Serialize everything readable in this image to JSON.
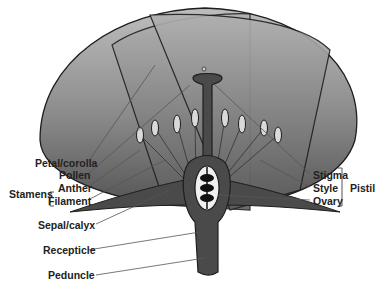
{
  "diagram": {
    "title": "",
    "labels": {
      "petal": "Petal/corolla",
      "pollen": "Pollen",
      "anther": "Anther",
      "filament": "Filament",
      "stamens": "Stamens",
      "sepal": "Sepal/calyx",
      "recepticle": "Recepticle",
      "peduncle": "Peduncle",
      "stigma": "Stigma",
      "style": "Style",
      "ovary": "Ovary",
      "pistil": "Pistil"
    },
    "colors": {
      "petal_light": "#b5b5b5",
      "petal_dark": "#6a6a6a",
      "body_dark": "#4a4a4a",
      "outline": "#1e1e1e",
      "leader_line": "#555555"
    }
  }
}
